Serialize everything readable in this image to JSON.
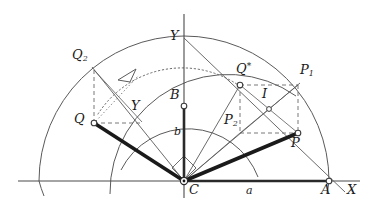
{
  "figure": {
    "background_color": "#ffffff",
    "line_color": "#4a4a4a",
    "thick_line_color": "#1a1a1a",
    "label_color": "#1a1a1a"
  },
  "axes": {
    "x_axis_label": "X",
    "y_axis_label": "Y",
    "origin_label": "C"
  },
  "points": [
    {
      "id": "C",
      "label": "C",
      "sub": "",
      "star": false,
      "x": 184,
      "y": 181,
      "lx": 190,
      "ly": 186,
      "marker": "origin"
    },
    {
      "id": "A",
      "label": "A",
      "sub": "",
      "star": false,
      "x": 329,
      "y": 181,
      "lx": 322,
      "ly": 186,
      "marker": "open"
    },
    {
      "id": "B",
      "label": "B",
      "sub": "",
      "star": false,
      "x": 184,
      "y": 106,
      "lx": 172,
      "ly": 92,
      "marker": "open"
    },
    {
      "id": "P",
      "label": "P",
      "sub": "",
      "star": false,
      "x": 298,
      "y": 133,
      "lx": 292,
      "ly": 142,
      "marker": "open"
    },
    {
      "id": "P1",
      "label": "P",
      "sub": "1",
      "star": false,
      "x": 298,
      "y": 85,
      "lx": 302,
      "ly": 71,
      "marker": "none"
    },
    {
      "id": "P2",
      "label": "P",
      "sub": "2",
      "star": false,
      "x": 240,
      "y": 133,
      "lx": 228,
      "ly": 120,
      "marker": "none"
    },
    {
      "id": "Qs",
      "label": "Q",
      "sub": "",
      "star": true,
      "x": 240,
      "y": 85,
      "lx": 238,
      "ly": 70,
      "marker": "open"
    },
    {
      "id": "I",
      "label": "I",
      "sub": "",
      "star": false,
      "x": 269,
      "y": 109,
      "lx": 263,
      "ly": 95,
      "marker": "open"
    },
    {
      "id": "Q",
      "label": "Q",
      "sub": "",
      "star": false,
      "x": 94,
      "y": 123,
      "lx": 76,
      "ly": 117,
      "marker": "open"
    },
    {
      "id": "Q1",
      "label": "Q",
      "sub": "1",
      "star": false,
      "x": 94,
      "y": 70,
      "lx": 72,
      "ly": 55,
      "marker": "none"
    },
    {
      "id": "Q2",
      "label": "Q",
      "sub": "2",
      "star": false,
      "x": 140,
      "y": 123,
      "lx": 131,
      "ly": 107,
      "marker": "none"
    },
    {
      "id": "Y",
      "label": "Y",
      "sub": "",
      "star": false,
      "x": 184,
      "y": 38,
      "lx": 172,
      "ly": 35,
      "marker": "none"
    }
  ],
  "segment_labels": [
    {
      "id": "a",
      "text": "a",
      "x": 248,
      "y": 186
    },
    {
      "id": "b",
      "text": "b",
      "x": 174,
      "y": 130
    }
  ],
  "arcs": {
    "outer_radius": 145,
    "middle_radius": 118,
    "inner_radius": 75,
    "dotted_motion_radius": 100
  },
  "annotations": {
    "rotation_arrow": "arrowhead pointing counter-clockwise along dotted arc from Q toward Q*",
    "right_angle_at_C": "square marker between CB and CP"
  }
}
